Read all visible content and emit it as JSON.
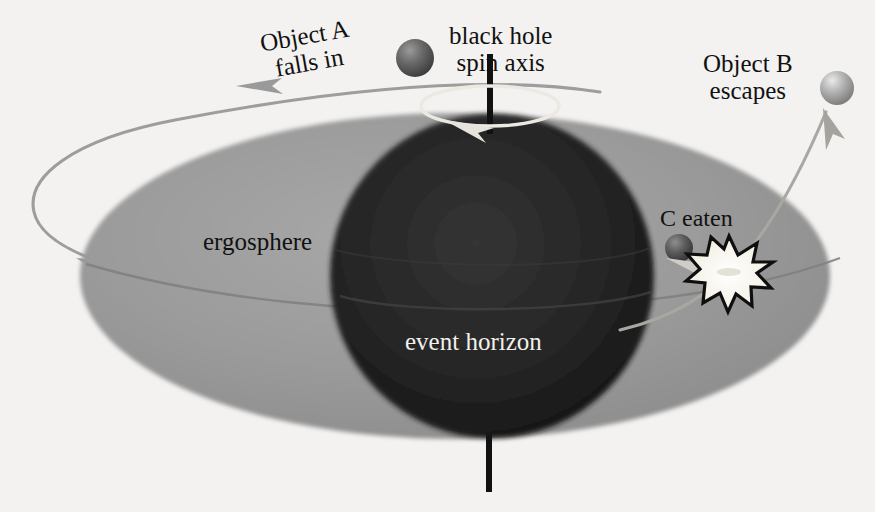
{
  "diagram": {
    "type": "astrophysics-schematic",
    "background_color": "#f3f2f0",
    "labels": {
      "object_a_line1": "Object A",
      "object_a_line2": "falls in",
      "black_hole_line1": "black hole",
      "black_hole_line2": "spin axis",
      "object_b_line1": "Object B",
      "object_b_line2": "escapes",
      "ergosphere": "ergosphere",
      "event_horizon": "event horizon",
      "c_eaten": "C eaten"
    },
    "shapes": {
      "ergosphere": {
        "name": "ergosphere-ellipse",
        "cx": 455,
        "cy": 276,
        "rx": 375,
        "ry": 163,
        "fill_light": "#9d9d9d",
        "fill_dark": "#8a8a8a"
      },
      "event_horizon": {
        "name": "event-horizon-sphere",
        "cx": 492,
        "cy": 276,
        "r": 162,
        "fill_center": "#2a2a2a",
        "fill_edge": "#171717"
      },
      "spin_axis": {
        "name": "spin-axis-bar",
        "x": 489,
        "top": 54,
        "bottom": 492,
        "width": 6,
        "color": "#111111"
      },
      "spin_ring": {
        "name": "spin-direction-ring",
        "cx": 490,
        "cy": 105,
        "rx": 68,
        "ry": 19,
        "color": "#e9e7e2"
      },
      "starburst": {
        "name": "collision-starburst",
        "cx": 729,
        "cy": 272,
        "r": 34,
        "fill": "#f6f3ea",
        "stroke": "#111111"
      },
      "sphere_a": {
        "name": "object-a-sphere",
        "cx": 415,
        "cy": 58,
        "r": 19,
        "color_light": "#8e8e8e",
        "color_dark": "#4a4a4a"
      },
      "sphere_b": {
        "name": "object-b-sphere",
        "cx": 837,
        "cy": 88,
        "r": 17,
        "color_light": "#d8d8d8",
        "color_dark": "#8d8d8d"
      },
      "sphere_c": {
        "name": "object-c-sphere",
        "cx": 679,
        "cy": 248,
        "r": 14,
        "color_light": "#8a8a8a",
        "color_dark": "#3f3f3f"
      }
    },
    "trajectories": [
      {
        "name": "infall-path-object-a",
        "description": "Object A spirals in from upper right, loops far left, re-enters toward the hole",
        "color": "#9a9a9a"
      },
      {
        "name": "escape-path-object-b",
        "description": "Object B leaves the collision point and escapes up to the right",
        "color": "#a6a4a0"
      },
      {
        "name": "equatorial-orbit-line",
        "description": "faint line crossing the ergosphere equator",
        "color": "#7d7d7d"
      }
    ],
    "arrows": [
      {
        "name": "arrow-infall-left",
        "points": "left along the upper infall curve"
      },
      {
        "name": "arrow-loop-lower-left",
        "points": "left-down on the far-left loop"
      },
      {
        "name": "arrow-spin-direction",
        "points": "clockwise around the spin axis"
      },
      {
        "name": "arrow-into-horizon",
        "points": "left, from the starburst into the event horizon"
      },
      {
        "name": "arrow-escape-up",
        "points": "up, toward Object B"
      }
    ]
  }
}
